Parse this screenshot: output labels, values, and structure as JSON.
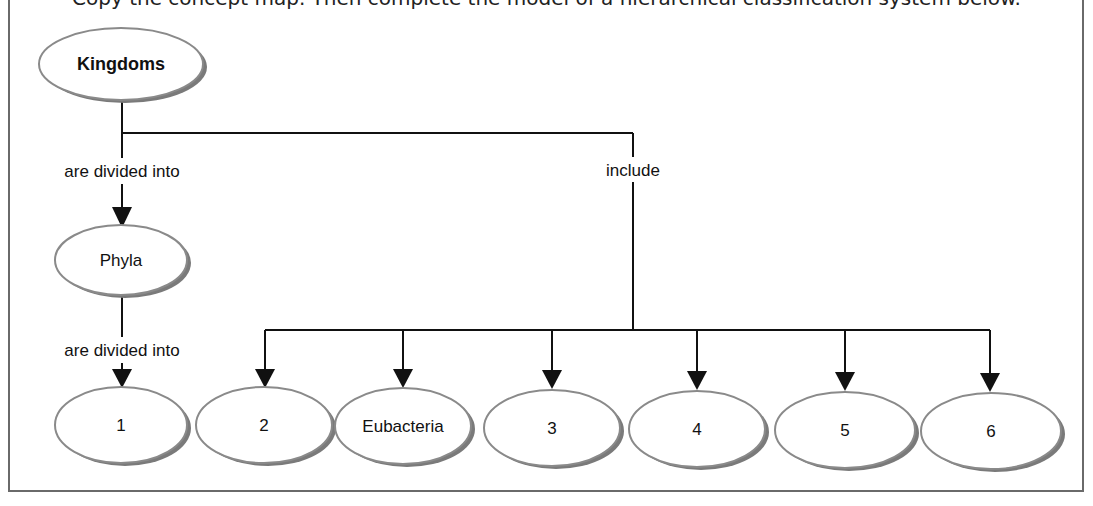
{
  "caption": "Copy the concept map. Then complete the model of a hierarchical classification system below.",
  "diagram": {
    "root": {
      "id": "kingdoms",
      "label": "Kingdoms"
    },
    "edges": {
      "divided_1": "are divided into",
      "include": "include",
      "divided_2": "are divided into"
    },
    "nodes": {
      "phyla": "Phyla",
      "n1": "1",
      "n2": "2",
      "eubacteria": "Eubacteria",
      "n3": "3",
      "n4": "4",
      "n5": "5",
      "n6": "6"
    }
  },
  "colors": {
    "line": "#111111",
    "ellipse_stroke": "#8a8a8a",
    "ellipse_shadow": "#7a7a7a",
    "frame": "#6a6a6a"
  }
}
